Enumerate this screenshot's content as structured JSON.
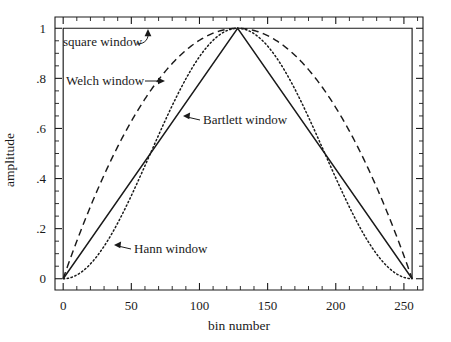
{
  "figure": {
    "title": "",
    "background": "#ffffff",
    "ink_color": "#1a1a1a"
  },
  "axes": {
    "xlabel": "bin number",
    "ylabel": "amplitude",
    "x_ticks": [
      "0",
      "50",
      "100",
      "150",
      "200",
      "250"
    ],
    "y_ticks": [
      "0",
      ".2",
      ".4",
      ".6",
      ".8",
      "1"
    ]
  },
  "annotations": {
    "square": "square window",
    "welch": "Welch window",
    "bartlett": "Bartlett window",
    "hann": "Hann window"
  },
  "chart_data": {
    "type": "line",
    "title": "",
    "xlabel": "bin number",
    "ylabel": "amplitude",
    "xlim": [
      -6,
      264
    ],
    "ylim": [
      -0.045,
      1.045
    ],
    "x_ticks": [
      0,
      50,
      100,
      150,
      200,
      250
    ],
    "y_ticks": [
      0,
      0.2,
      0.4,
      0.6,
      0.8,
      1.0
    ],
    "x_minor_step": 10,
    "y_minor_step": 0.05,
    "grid": false,
    "legend": "none (inline annotated labels with leader arrows)",
    "N": 256,
    "series": [
      {
        "name": "square window",
        "style": "solid",
        "formula": "w[j] = 1 for 0 <= j <= N",
        "x": [
          0,
          0,
          256,
          256
        ],
        "values": [
          0,
          1,
          1,
          0
        ]
      },
      {
        "name": "Bartlett window",
        "style": "solid",
        "formula": "w[j] = 1 - |(j - N/2) / (N/2)|",
        "x": [
          0,
          16,
          32,
          48,
          64,
          80,
          96,
          112,
          128,
          144,
          160,
          176,
          192,
          208,
          224,
          240,
          256
        ],
        "values": [
          0,
          0.125,
          0.25,
          0.375,
          0.5,
          0.625,
          0.75,
          0.875,
          1,
          0.875,
          0.75,
          0.625,
          0.5,
          0.375,
          0.25,
          0.125,
          0
        ]
      },
      {
        "name": "Welch window",
        "style": "dashed",
        "formula": "w[j] = 1 - ((j - N/2) / (N/2))^2",
        "x": [
          0,
          16,
          32,
          48,
          64,
          80,
          96,
          112,
          128,
          144,
          160,
          176,
          192,
          208,
          224,
          240,
          256
        ],
        "values": [
          0,
          0.234,
          0.438,
          0.609,
          0.75,
          0.859,
          0.938,
          0.984,
          1,
          0.984,
          0.938,
          0.859,
          0.75,
          0.609,
          0.438,
          0.234,
          0
        ]
      },
      {
        "name": "Hann window",
        "style": "dotted",
        "formula": "w[j] = 0.5 * (1 - cos(2*pi*j/N))",
        "x": [
          0,
          16,
          32,
          48,
          64,
          80,
          96,
          112,
          128,
          144,
          160,
          176,
          192,
          208,
          224,
          240,
          256
        ],
        "values": [
          0,
          0.038,
          0.146,
          0.309,
          0.5,
          0.691,
          0.854,
          0.962,
          1,
          0.962,
          0.854,
          0.691,
          0.5,
          0.309,
          0.146,
          0.038,
          0
        ]
      }
    ]
  }
}
